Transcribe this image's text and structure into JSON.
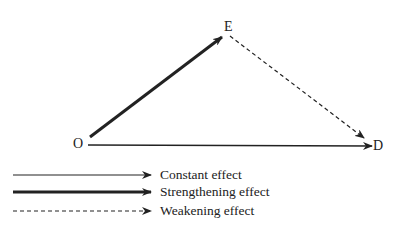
{
  "nodes": {
    "O": "O",
    "E": "E",
    "D": "D"
  },
  "edges": [
    {
      "from": "O",
      "to": "E",
      "type": "strengthening"
    },
    {
      "from": "E",
      "to": "D",
      "type": "weakening"
    },
    {
      "from": "O",
      "to": "D",
      "type": "constant"
    }
  ],
  "legend": [
    {
      "style": "solid-thin",
      "label": "Constant effect"
    },
    {
      "style": "solid-thick",
      "label": "Strengthening effect"
    },
    {
      "style": "dashed",
      "label": "Weakening effect"
    }
  ],
  "colors": {
    "ink": "#222222",
    "background": "#ffffff"
  }
}
